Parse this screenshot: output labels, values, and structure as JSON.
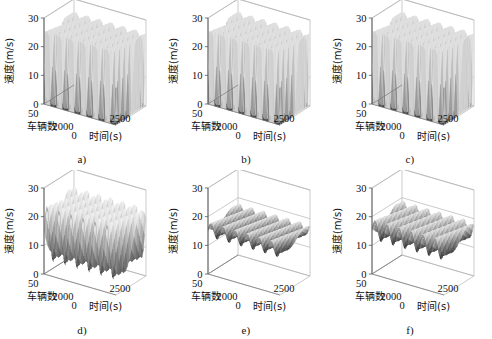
{
  "figure": {
    "panel_labels": [
      "a)",
      "b)",
      "c)",
      "d)",
      "e)",
      "f)"
    ]
  },
  "axes": {
    "z_label": "速度(m/s)",
    "z_ticks": [
      "0",
      "10",
      "20",
      "30"
    ],
    "y_label": "车辆数",
    "y_ticks": [
      "0",
      "50"
    ],
    "x_label": "时间(s)",
    "x_ticks": [
      "2000",
      "2500"
    ]
  },
  "chart_data": {
    "type": "surface",
    "title": "",
    "layout": "2 rows x 3 columns of 3D surface plots",
    "zlabel": "速度(m/s)",
    "ylabel": "车辆数",
    "xlabel": "时间(s)",
    "zlim": [
      0,
      30
    ],
    "ylim": [
      0,
      50
    ],
    "xlim": [
      2000,
      2500
    ],
    "ztick_values": [
      0,
      10,
      20,
      30
    ],
    "ytick_values": [
      0,
      50
    ],
    "xtick_values": [
      2000,
      2500
    ],
    "grid": true,
    "legend": "none",
    "colormap": "grayscale (dark = low speed, light = high speed)",
    "panels": [
      {
        "label": "a)",
        "description": "Dense stop-and-go traffic: full-height corrugated wall spanning 0 to ~26 m/s with deep vertical troughs reaching 0 m/s",
        "wave_count": 6,
        "surface_min": 0,
        "surface_max": 26,
        "mean_speed": 13,
        "amplitude": 13
      },
      {
        "label": "b)",
        "description": "Dense stop-and-go traffic: full-height corrugated wall spanning 0 to ~26 m/s with deep vertical troughs reaching 0 m/s",
        "wave_count": 6,
        "surface_min": 0,
        "surface_max": 26,
        "mean_speed": 13,
        "amplitude": 13
      },
      {
        "label": "c)",
        "description": "Dense stop-and-go traffic: full-height corrugated wall spanning 0 to ~26 m/s with deep vertical troughs reaching 0 m/s",
        "wave_count": 6,
        "surface_min": 0,
        "surface_max": 26,
        "mean_speed": 13,
        "amplitude": 13
      },
      {
        "label": "d)",
        "description": "Large-amplitude rolling waves around 15 m/s mean with rounded crests near 22 m/s and valleys dropping to ~3 m/s",
        "wave_count": 6,
        "surface_min": 3,
        "surface_max": 22,
        "mean_speed": 15,
        "amplitude": 9
      },
      {
        "label": "e)",
        "description": "Nearly flat sheet near 16 m/s with shallow diagonal stripe oscillations",
        "wave_count": 6,
        "surface_min": 14,
        "surface_max": 18,
        "mean_speed": 16,
        "amplitude": 2
      },
      {
        "label": "f)",
        "description": "Nearly flat sheet near 16 m/s with shallow diagonal stripe oscillations slightly stronger than panel e",
        "wave_count": 6,
        "surface_min": 13,
        "surface_max": 19,
        "mean_speed": 16,
        "amplitude": 3
      }
    ]
  }
}
